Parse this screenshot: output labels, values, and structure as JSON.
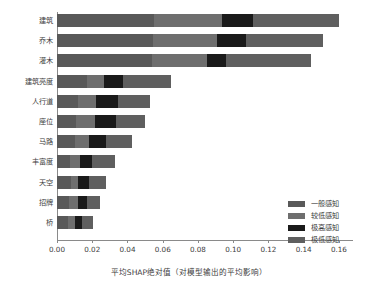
{
  "chart_data": {
    "type": "bar",
    "orientation": "horizontal",
    "stacked": true,
    "title": "",
    "xlabel": "平均SHAP绝对值（对模型输出的平均影响）",
    "ylabel": "",
    "xlim": [
      0.0,
      0.168
    ],
    "grid": false,
    "legend_position": "lower-right",
    "xticks": [
      "0.00",
      "0.02",
      "0.04",
      "0.06",
      "0.08",
      "0.10",
      "0.12",
      "0.14",
      "0.16"
    ],
    "xtick_values": [
      0.0,
      0.02,
      0.04,
      0.06,
      0.08,
      0.1,
      0.12,
      0.14,
      0.16
    ],
    "categories": [
      "建筑",
      "乔木",
      "灌木",
      "建筑亮度",
      "人行道",
      "座位",
      "马路",
      "丰富度",
      "天空",
      "招牌",
      "桥"
    ],
    "series": [
      {
        "name": "一般感知",
        "color": "#595959",
        "values": [
          0.0553,
          0.0543,
          0.054,
          0.0168,
          0.0118,
          0.011,
          0.01,
          0.0071,
          0.0082,
          0.0068,
          0.0061
        ]
      },
      {
        "name": "较低感知",
        "color": "#6e6e6e",
        "values": [
          0.0384,
          0.0363,
          0.031,
          0.01,
          0.0103,
          0.0106,
          0.0081,
          0.0059,
          0.0039,
          0.0049,
          0.004
        ]
      },
      {
        "name": "极高感知",
        "color": "#1a1a1a",
        "values": [
          0.0175,
          0.0167,
          0.0108,
          0.0108,
          0.0125,
          0.0117,
          0.01,
          0.0068,
          0.0058,
          0.0053,
          0.0043
        ]
      },
      {
        "name": "极低感知",
        "color": "#5f5f5f",
        "values": [
          0.0488,
          0.0435,
          0.0485,
          0.027,
          0.0184,
          0.0168,
          0.0143,
          0.013,
          0.0098,
          0.0073,
          0.0062
        ]
      }
    ],
    "totals": [
      0.16,
      0.1508,
      0.1443,
      0.0646,
      0.053,
      0.0501,
      0.0424,
      0.0328,
      0.0277,
      0.0243,
      0.0206
    ]
  },
  "legend": {
    "items": [
      {
        "label": "一般感知",
        "color": "#595959"
      },
      {
        "label": "较低感知",
        "color": "#6e6e6e"
      },
      {
        "label": "极高感知",
        "color": "#1a1a1a"
      },
      {
        "label": "极低感知",
        "color": "#5f5f5f"
      }
    ]
  },
  "colors": {
    "axis": "#8a8a8a",
    "text": "#3d3d3d",
    "background": "#ffffff"
  }
}
